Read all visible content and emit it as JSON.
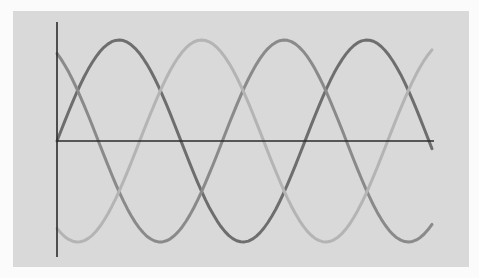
{
  "chart_data": {
    "type": "line",
    "title": "",
    "xlabel": "",
    "ylabel": "",
    "grid": false,
    "legend": null,
    "x_range": [
      0,
      1.52
    ],
    "y_range": [
      -1.15,
      1.2
    ],
    "x_unit": "cycles",
    "samples": 96,
    "series": [
      {
        "name": "phase-a",
        "color": "#6e6e6e",
        "phase_deg": 0,
        "amplitude": 1.0
      },
      {
        "name": "phase-b",
        "color": "#8a8a8a",
        "phase_deg": 120,
        "amplitude": 1.0
      },
      {
        "name": "phase-c",
        "color": "#b4b4b4",
        "phase_deg": 240,
        "amplitude": 1.0
      }
    ],
    "sampled_points": {
      "x": [
        0,
        0.25,
        0.5,
        0.75,
        1.0,
        1.25,
        1.5
      ],
      "phase-a": [
        0.0,
        1.0,
        0.0,
        -1.0,
        0.0,
        1.0,
        0.0
      ],
      "phase-b": [
        0.87,
        -0.5,
        -0.87,
        0.5,
        0.87,
        -0.5,
        -0.87
      ],
      "phase-c": [
        -0.87,
        -0.5,
        0.87,
        0.5,
        -0.87,
        -0.5,
        0.87
      ]
    }
  },
  "colors": {
    "page_background": "#fbfbfb",
    "panel_background": "#d9d9d9",
    "axis": "#2b2b2b"
  },
  "layout": {
    "origin_x": 57,
    "origin_y": 141,
    "x_end": 434,
    "y_top": 22,
    "y_bottom": 257,
    "period_px": 248,
    "amplitude_px": 101,
    "curve_x_end": 432
  }
}
